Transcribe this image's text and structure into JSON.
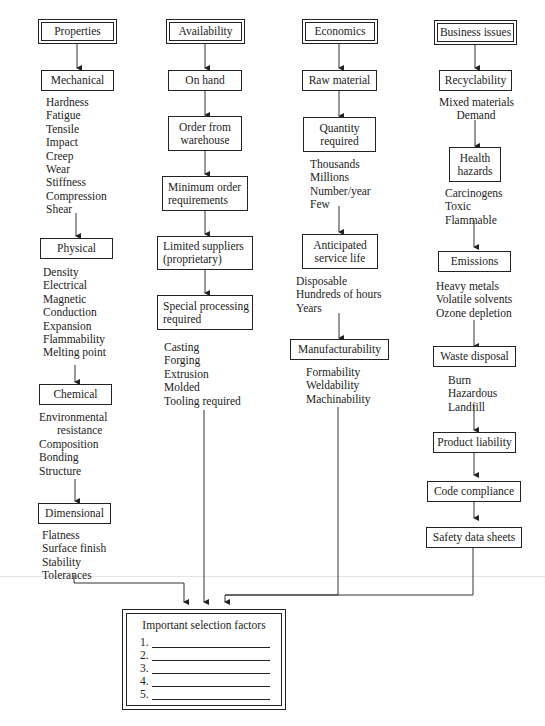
{
  "diagram": {
    "columns": [
      {
        "header": "Properties",
        "groups": [
          {
            "title": "Mechanical",
            "items": [
              "Hardness",
              "Fatigue",
              "Tensile",
              "Impact",
              "Creep",
              "Wear",
              "Stiffness",
              "Compression",
              "Shear"
            ]
          },
          {
            "title": "Physical",
            "items": [
              "Density",
              "Electrical",
              "Magnetic",
              "Conduction",
              "Expansion",
              "Flammability",
              "Melting point"
            ]
          },
          {
            "title": "Chemical",
            "items": [
              "Environmental",
              "resistance",
              "Composition",
              "Bonding",
              "Structure"
            ]
          },
          {
            "title": "Dimensional",
            "items": [
              "Flatness",
              "Surface finish",
              "Stability",
              "Tolerances"
            ]
          }
        ]
      },
      {
        "header": "Availability",
        "groups": [
          {
            "title": "On hand",
            "items": []
          },
          {
            "title": "Order from warehouse",
            "title_lines": [
              "Order from",
              "warehouse"
            ],
            "items": []
          },
          {
            "title": "Minimum order requirements",
            "title_lines": [
              "Minimum order",
              "requirements"
            ],
            "items": []
          },
          {
            "title": "Limited suppliers (proprietary)",
            "title_lines": [
              "Limited suppliers",
              "(proprietary)"
            ],
            "items": []
          },
          {
            "title": "Special processing required",
            "title_lines": [
              "Special processing",
              "required"
            ],
            "items": [
              "Casting",
              "Forging",
              "Extrusion",
              "Molded",
              "Tooling required"
            ]
          }
        ]
      },
      {
        "header": "Economics",
        "groups": [
          {
            "title": "Raw material",
            "items": []
          },
          {
            "title": "Quantity required",
            "title_lines": [
              "Quantity",
              "required"
            ],
            "items": [
              "Thousands",
              "Millions",
              "Number/year",
              "Few"
            ]
          },
          {
            "title": "Anticipated service life",
            "title_lines": [
              "Anticipated",
              "service life"
            ],
            "items": [
              "Disposable",
              "Hundreds of hours",
              "Years"
            ]
          },
          {
            "title": "Manufacturability",
            "items": [
              "Formability",
              "Weldability",
              "Machinability"
            ]
          }
        ]
      },
      {
        "header": "Business issues",
        "groups": [
          {
            "title": "Recyclability",
            "items": [
              "Mixed materials",
              "Demand"
            ]
          },
          {
            "title": "Health hazards",
            "title_lines": [
              "Health",
              "hazards"
            ],
            "items": [
              "Carcinogens",
              "Toxic",
              "Flammable"
            ]
          },
          {
            "title": "Emissions",
            "items": [
              "Heavy metals",
              "Volatile solvents",
              "Ozone depletion"
            ]
          },
          {
            "title": "Waste disposal",
            "items": [
              "Burn",
              "Hazardous",
              "Landfill"
            ]
          },
          {
            "title": "Product liability",
            "items": []
          },
          {
            "title": "Code compliance",
            "items": []
          },
          {
            "title": "Safety data sheets",
            "items": []
          }
        ]
      }
    ],
    "final": {
      "title": "Important selection factors",
      "blanks": [
        "1.",
        "2.",
        "3.",
        "4.",
        "5."
      ]
    },
    "colors": {
      "stroke": "#222222",
      "background": "#ffffff"
    }
  }
}
